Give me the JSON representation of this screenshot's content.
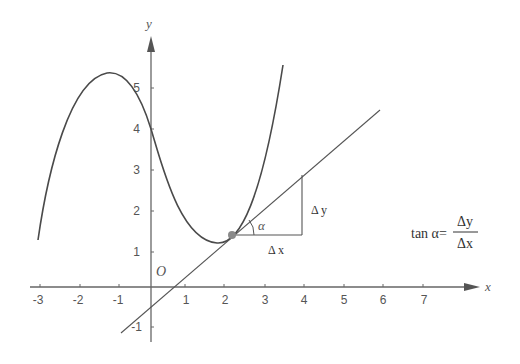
{
  "diagram": {
    "type": "function-tangent-slope",
    "axes": {
      "x_label": "x",
      "y_label": "y",
      "origin_label": "O",
      "x_ticks": [
        "-3",
        "-2",
        "-1",
        "1",
        "2",
        "3",
        "4",
        "5",
        "6",
        "7"
      ],
      "y_ticks": [
        "5",
        "4",
        "3",
        "2",
        "1",
        "-1"
      ]
    },
    "triangle": {
      "angle_label": "α",
      "dx_label": "Δ x",
      "dy_label": "Δ y"
    },
    "formula": {
      "lhs": "tan α=",
      "numerator": "Δy",
      "denominator": "Δx"
    },
    "colors": {
      "axis": "#666666",
      "curve": "#4a4a4a",
      "tangent": "#555555",
      "point": "#8a8a8a"
    }
  }
}
